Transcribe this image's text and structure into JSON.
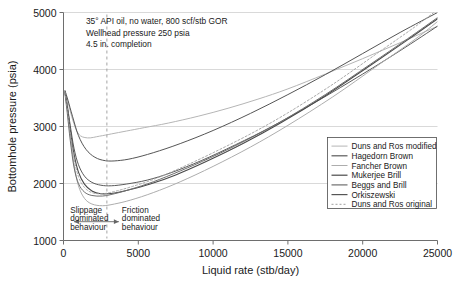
{
  "figure": {
    "background": "#ffffff",
    "frame_color": "#808080"
  },
  "chart_data": {
    "type": "line",
    "title": "",
    "xlabel": "Liquid rate (stb/day)",
    "ylabel": "Bottomhole pressure (psia)",
    "xlim": [
      0,
      25000
    ],
    "ylim": [
      1000,
      5000
    ],
    "xticks": [
      0,
      5000,
      10000,
      15000,
      20000,
      25000
    ],
    "yticks": [
      1000,
      2000,
      3000,
      4000,
      5000
    ],
    "xtick_labels": [
      "0",
      "5000",
      "10000",
      "15000",
      "20000",
      "25000"
    ],
    "ytick_labels": [
      "1000",
      "2000",
      "3000",
      "4000",
      "5000"
    ],
    "grid": "horizontal",
    "legend_position": "lower-right",
    "annotations": [
      {
        "name": "conditions-line-1",
        "text": "35° API oil, no water, 800 scf/stb GOR",
        "x": 1500,
        "y": 4790
      },
      {
        "name": "conditions-line-2",
        "text": "Wellhead pressure 250 psia",
        "x": 1500,
        "y": 4590
      },
      {
        "name": "conditions-line-3",
        "text": "4.5 in. completion",
        "x": 1500,
        "y": 4390
      },
      {
        "name": "slippage-label-1",
        "text": "Slippage",
        "x": 450,
        "y": 1490
      },
      {
        "name": "slippage-label-2",
        "text": "dominated",
        "x": 450,
        "y": 1340
      },
      {
        "name": "slippage-label-3",
        "text": "behaviour",
        "x": 450,
        "y": 1190
      },
      {
        "name": "friction-label-1",
        "text": "Friction",
        "x": 3900,
        "y": 1490
      },
      {
        "name": "friction-label-2",
        "text": "dominated",
        "x": 3900,
        "y": 1340
      },
      {
        "name": "friction-label-3",
        "text": "behaviour",
        "x": 3900,
        "y": 1190
      }
    ],
    "divider": {
      "name": "regime-divider",
      "x": 2900,
      "style": "dashed",
      "color": "#9a9a9a"
    },
    "regime_arrow": {
      "name": "regime-arrow",
      "x_start": 700,
      "x_end": 3700,
      "y": 1330,
      "color": "#666666"
    },
    "series": [
      {
        "name": "Duns and Ros modified",
        "color": "#b5b5b5",
        "width": 1.0,
        "dash": "none",
        "x": [
          100,
          300,
          600,
          1000,
          1600,
          2400,
          3200,
          4200,
          5400,
          7000,
          9000,
          11000,
          13000,
          15000,
          17500,
          20000,
          22500,
          25000
        ],
        "y": [
          3620,
          3430,
          3130,
          2870,
          2800,
          2830,
          2870,
          2920,
          2980,
          3060,
          3180,
          3320,
          3480,
          3660,
          3920,
          4190,
          4470,
          4760
        ]
      },
      {
        "name": "Hagedorn Brown",
        "color": "#5a5a5a",
        "width": 1.0,
        "dash": "none",
        "x": [
          100,
          250,
          450,
          700,
          1000,
          1400,
          1900,
          2500,
          3200,
          4200,
          5600,
          7200,
          9200,
          11500,
          14000,
          17000,
          20000,
          22500,
          25000
        ],
        "y": [
          3610,
          3380,
          3020,
          2620,
          2330,
          2130,
          2020,
          1970,
          1960,
          1990,
          2060,
          2190,
          2400,
          2680,
          3010,
          3450,
          3920,
          4330,
          4760
        ]
      },
      {
        "name": "Fancher Brown",
        "color": "#adadad",
        "width": 1.0,
        "dash": "none",
        "x": [
          100,
          250,
          450,
          700,
          1000,
          1400,
          1900,
          2600,
          3400,
          4500,
          6000,
          7800,
          10000,
          12500,
          15000,
          18000,
          21000,
          23500,
          25000
        ],
        "y": [
          3590,
          3300,
          2850,
          2340,
          1960,
          1740,
          1640,
          1610,
          1640,
          1710,
          1840,
          2030,
          2300,
          2640,
          3020,
          3520,
          4070,
          4530,
          4840
        ]
      },
      {
        "name": "Mukerjee Brill",
        "color": "#4a4a4a",
        "width": 1.1,
        "dash": "none",
        "x": [
          100,
          250,
          450,
          700,
          1000,
          1400,
          1900,
          2500,
          3300,
          4400,
          5800,
          7500,
          9500,
          12000,
          14500,
          17500,
          20500,
          23000,
          25000
        ],
        "y": [
          3600,
          3350,
          2960,
          2520,
          2200,
          1990,
          1870,
          1820,
          1830,
          1890,
          1990,
          2150,
          2380,
          2700,
          3060,
          3540,
          4070,
          4520,
          4890
        ]
      },
      {
        "name": "Beggs and Brill",
        "color": "#6e6e6e",
        "width": 1.0,
        "dash": "none",
        "x": [
          100,
          250,
          450,
          700,
          1000,
          1400,
          1900,
          2600,
          3400,
          4500,
          6000,
          7800,
          9800,
          12000,
          14500,
          17500,
          20500,
          23000,
          25000
        ],
        "y": [
          3570,
          3240,
          2760,
          2290,
          2000,
          1850,
          1790,
          1780,
          1820,
          1900,
          2030,
          2220,
          2450,
          2730,
          3080,
          3560,
          4090,
          4540,
          4910
        ]
      },
      {
        "name": "Orkiszewski",
        "color": "#555555",
        "width": 1.0,
        "dash": "none",
        "x": [
          100,
          300,
          600,
          1000,
          1500,
          2100,
          2800,
          3600,
          4600,
          6000,
          7800,
          10000,
          12500,
          15000,
          17500,
          20000,
          22500,
          25000
        ],
        "y": [
          3630,
          3460,
          3180,
          2840,
          2600,
          2460,
          2400,
          2400,
          2440,
          2540,
          2700,
          2930,
          3230,
          3560,
          3910,
          4280,
          4650,
          5000
        ]
      },
      {
        "name": "Duns and Ros original",
        "color": "#a0a0a0",
        "width": 0.9,
        "dash": "dotted",
        "x": [
          100,
          250,
          450,
          700,
          1000,
          1400,
          1900,
          2600,
          3400,
          4500,
          6000,
          7800,
          10000,
          12500,
          15000,
          18000,
          21000,
          23500,
          25000
        ],
        "y": [
          3600,
          3320,
          2900,
          2450,
          2120,
          1930,
          1840,
          1820,
          1860,
          1940,
          2070,
          2270,
          2540,
          2870,
          3240,
          3740,
          4290,
          4750,
          5050
        ]
      }
    ],
    "legend_entries": [
      {
        "label": "Duns and Ros modified",
        "color": "#b5b5b5",
        "dash": "none",
        "width": 1.0
      },
      {
        "label": "Hagedorn Brown",
        "color": "#5a5a5a",
        "dash": "none",
        "width": 1.2
      },
      {
        "label": "Fancher Brown",
        "color": "#adadad",
        "dash": "none",
        "width": 1.0
      },
      {
        "label": "Mukerjee Brill",
        "color": "#4a4a4a",
        "dash": "none",
        "width": 1.2
      },
      {
        "label": "Beggs and Brill",
        "color": "#6e6e6e",
        "dash": "none",
        "width": 1.2
      },
      {
        "label": "Orkiszewski",
        "color": "#555555",
        "dash": "none",
        "width": 1.2
      },
      {
        "label": "Duns and Ros original",
        "color": "#a0a0a0",
        "dash": "dotted",
        "width": 1.0
      }
    ]
  }
}
